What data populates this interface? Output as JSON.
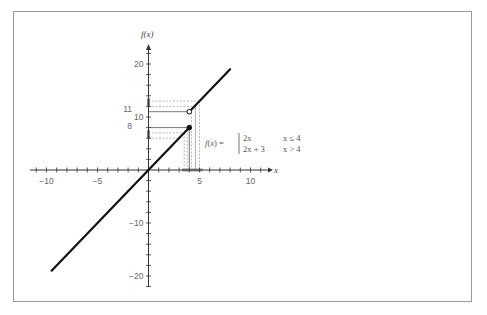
{
  "chart_data": {
    "type": "line",
    "title": "",
    "xlabel": "x",
    "ylabel": "f(x)",
    "xlim": [
      -11.5,
      12
    ],
    "ylim": [
      -22,
      24
    ],
    "grid": false,
    "x_ticks": [
      -10,
      -5,
      5,
      10
    ],
    "x_tick_labels": [
      "−10",
      "−5",
      "5",
      "10"
    ],
    "y_ticks": [
      20,
      10,
      -10,
      -20
    ],
    "y_tick_labels": [
      "20",
      "10",
      "−10",
      "−20"
    ],
    "annotations": {
      "y_value_labels": [
        {
          "value": 11,
          "label": "11"
        },
        {
          "value": 8,
          "label": "8"
        }
      ],
      "equation": {
        "lhs": "f(x) =",
        "cases": [
          {
            "expr": "2x",
            "condition": "x ≤ 4"
          },
          {
            "expr": "2x + 3",
            "condition": "x > 4"
          }
        ]
      }
    },
    "series": [
      {
        "name": "2x (x ≤ 4)",
        "x": [
          -9.5,
          4
        ],
        "y": [
          -19,
          8
        ],
        "endpoint": "closed"
      },
      {
        "name": "2x + 3 (x > 4)",
        "x": [
          4,
          8
        ],
        "y": [
          11,
          19
        ],
        "endpoint": "open"
      }
    ],
    "points": [
      {
        "x": 4,
        "y": 8,
        "style": "filled"
      },
      {
        "x": 4,
        "y": 11,
        "style": "open"
      }
    ],
    "guide_lines": {
      "vertical_dashed_x": [
        3.5,
        3.8,
        4.2,
        5
      ],
      "horizontal_dashed_y": [
        6,
        7,
        12,
        13
      ],
      "solid_x": 4
    }
  }
}
